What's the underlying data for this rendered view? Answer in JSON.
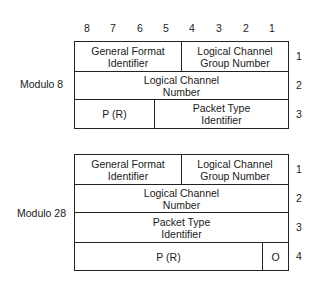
{
  "bit_positions": [
    "8",
    "7",
    "6",
    "5",
    "4",
    "3",
    "2",
    "1"
  ],
  "modulo8": {
    "label": "Modulo 8",
    "fields": {
      "gfi": "General Format Identifier",
      "lcgn": "Logical Channel Group Number",
      "lcn": "Logical Channel Number",
      "pr": "P (R)",
      "pti": "Packet Type Identifier"
    },
    "octets": [
      "1",
      "2",
      "3"
    ]
  },
  "modulo128": {
    "label": "Modulo 28",
    "fields": {
      "gfi": "General Format Identifier",
      "lcgn": "Logical Channel Group Number",
      "lcn": "Logical Channel Number",
      "pti": "Packet Type Identifier",
      "pr": "P (R)",
      "o": "O"
    },
    "octets": [
      "1",
      "2",
      "3",
      "4"
    ]
  }
}
